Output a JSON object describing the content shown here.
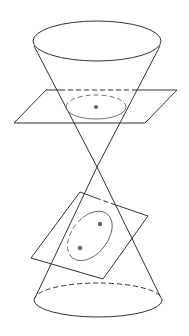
{
  "diagram": {
    "colors": {
      "line": "#333333",
      "section": "#666666",
      "background": "#ffffff"
    },
    "upper_nappe": {
      "rim": {
        "cx": 97,
        "cy": 41,
        "rx": 64,
        "ry": 20
      },
      "apex": [
        97,
        167
      ]
    },
    "lower_nappe": {
      "rim": {
        "cx": 98,
        "cy": 300,
        "rx": 64,
        "ry": 17
      },
      "apex": [
        97,
        167
      ]
    },
    "horizontal_plane": {
      "corners": [
        [
          46,
          90
        ],
        [
          177,
          90
        ],
        [
          145,
          123
        ],
        [
          14,
          123
        ]
      ],
      "section": "circle",
      "center": [
        96,
        107
      ]
    },
    "tilted_plane": {
      "corners": [
        [
          80,
          192
        ],
        [
          148,
          216
        ],
        [
          103,
          279
        ],
        [
          31,
          258
        ]
      ],
      "section": "ellipse",
      "foci": [
        [
          100,
          224
        ],
        [
          80,
          248
        ]
      ]
    }
  }
}
